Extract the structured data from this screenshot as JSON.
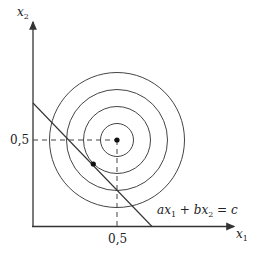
{
  "labels": {
    "x_axis": "x",
    "x_axis_sub": "1",
    "y_axis": "x",
    "y_axis_sub": "2",
    "x_tick": "0,5",
    "y_tick": "0,5",
    "constraint": {
      "a": "a",
      "x1": "x",
      "s1": "1",
      "plus": " + ",
      "b": "b",
      "x2": "x",
      "s2": "2",
      "eq": " = ",
      "c": "c"
    }
  },
  "colors": {
    "stroke": "#333333"
  },
  "circles": {
    "count": 4,
    "center": [
      0.5,
      0.5
    ]
  }
}
